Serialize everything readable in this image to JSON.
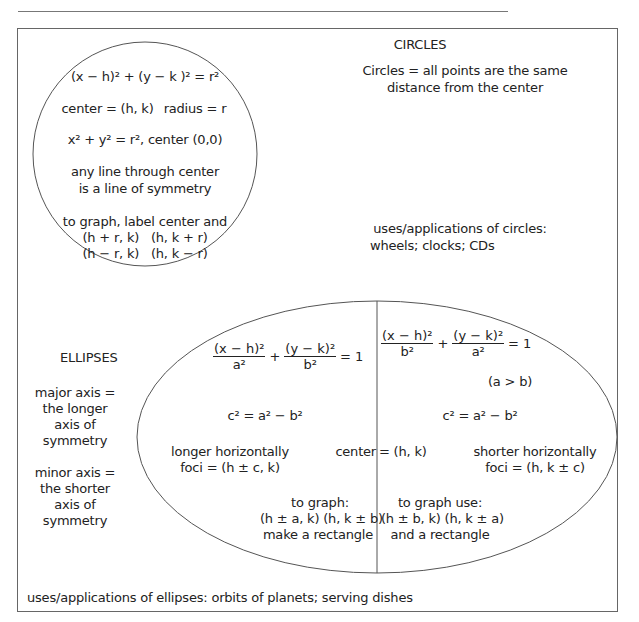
{
  "header": {
    "cut_off_text": ""
  },
  "circles": {
    "title": "CIRCLES",
    "definition": [
      "Circles = all points are the same",
      "distance from the center"
    ],
    "standard_form": "(x − h)² + (y − k )² = r²",
    "center_label": "center = (h, k)",
    "radius_label": "radius = r",
    "origin_form": "x² + y² = r², center (0,0)",
    "symmetry": [
      "any line through center",
      "is a line of symmetry"
    ],
    "graphing": [
      "to graph, label center and",
      "(h + r, k)   (h, k + r)",
      "(h − r, k)   (h, k − r)"
    ],
    "uses": [
      "uses/applications of circles:",
      "wheels; clocks; CDs"
    ]
  },
  "ellipses": {
    "title": "ELLIPSES",
    "major_axis": [
      "major axis =",
      "the longer",
      "axis of",
      "symmetry"
    ],
    "minor_axis": [
      "minor axis =",
      "the shorter",
      "axis of",
      "symmetry"
    ],
    "horizontal": {
      "eq_num1": "(x − h)²",
      "eq_den1": "a²",
      "eq_num2": "(y − k)²",
      "eq_den2": "b²",
      "eq_rhs": "= 1",
      "c_relation": "c² = a² − b²",
      "orientation": "longer horizontally",
      "foci": "foci = (h ± c, k)",
      "graphing": [
        "to graph:",
        "(h ± a, k) (h, k ± b)",
        "make a rectangle"
      ]
    },
    "vertical": {
      "eq_num1": "(x − h)²",
      "eq_den1": "b²",
      "eq_num2": "(y − k)²",
      "eq_den2": "a²",
      "eq_rhs": "= 1",
      "condition": "(a > b)",
      "c_relation": "c² = a² − b²",
      "orientation": "shorter horizontally",
      "foci": "foci = (h, k ± c)",
      "graphing": [
        "to graph use:",
        "(h ± b, k) (h, k ± a)",
        "and a rectangle"
      ]
    },
    "center_left": "center",
    "center_right": "= (h, k)",
    "uses": "uses/applications of ellipses: orbits of planets; serving dishes"
  }
}
